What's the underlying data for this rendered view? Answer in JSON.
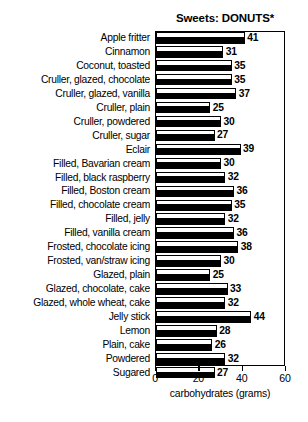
{
  "chart_data": {
    "type": "bar",
    "orientation": "horizontal",
    "title": "Sweets: DONUTS*",
    "xlabel": "carbohydrates (grams)",
    "ylabel": "",
    "xlim": [
      0,
      60
    ],
    "xticks": [
      0,
      20,
      40,
      60
    ],
    "xtick_labels": [
      "0",
      "20",
      "40",
      "60"
    ],
    "grid": false,
    "legend": null,
    "categories": [
      "Apple fritter",
      "Cinnamon",
      "Coconut, toasted",
      "Cruller, glazed, chocolate",
      "Cruller, glazed, vanilla",
      "Cruller, plain",
      "Cruller, powdered",
      "Cruller, sugar",
      "Eclair",
      "Filled, Bavarian cream",
      "Filled, black raspberry",
      "Filled, Boston cream",
      "Filled, chocolate cream",
      "Filled, jelly",
      "Filled, vanilla cream",
      "Frosted, chocolate icing",
      "Frosted, van/straw icing",
      "Glazed, plain",
      "Glazed, chocolate, cake",
      "Glazed, whole wheat, cake",
      "Jelly stick",
      "Lemon",
      "Plain, cake",
      "Powdered",
      "Sugared"
    ],
    "values": [
      41,
      31,
      35,
      35,
      37,
      25,
      30,
      27,
      39,
      30,
      32,
      36,
      35,
      32,
      36,
      38,
      30,
      25,
      33,
      32,
      44,
      28,
      26,
      32,
      27
    ],
    "value_labels": [
      "41",
      "31",
      "35",
      "35",
      "37",
      "25",
      "30",
      "27",
      "39",
      "30",
      "32",
      "36",
      "35",
      "32",
      "36",
      "38",
      "30",
      "25",
      "33",
      "32",
      "44",
      "28",
      "26",
      "32",
      "27"
    ]
  },
  "colors": {
    "bar_fill_upper": "#ffffff",
    "bar_fill_lower": "#000000",
    "bar_outline": "#000000",
    "axis": "#000000",
    "background": "#ffffff",
    "text": "#000000"
  }
}
